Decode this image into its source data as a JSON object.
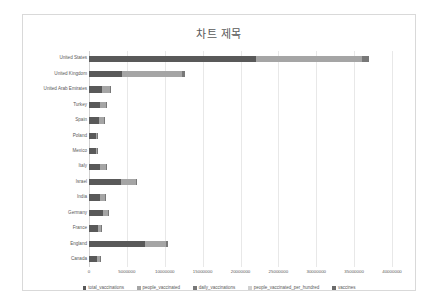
{
  "chart": {
    "title": "차트 제목"
  },
  "legend": {
    "position": "bottom",
    "items": [
      {
        "label": "total_vaccinations",
        "color": "#595959"
      },
      {
        "label": "people_vaccinated",
        "color": "#a5a5a5"
      },
      {
        "label": "daily_vaccinations",
        "color": "#787878"
      },
      {
        "label": "people_vaccinated_per_hundred",
        "color": "#d0d0d0"
      },
      {
        "label": "vaccines",
        "color": "#6b6b6b"
      }
    ]
  },
  "x_axis": {
    "ticks": [
      "0",
      "5000000",
      "10000000",
      "15000000",
      "20000000",
      "25000000",
      "30000000",
      "35000000",
      "40000000"
    ]
  },
  "chart_data": {
    "type": "bar",
    "orientation": "horizontal",
    "stacked": true,
    "title": "차트 제목",
    "xlabel": "",
    "ylabel": "",
    "xlim": [
      0,
      40000000
    ],
    "grid": true,
    "legend_position": "bottom",
    "categories": [
      "United States",
      "United Kingdom",
      "United Arab Emirates",
      "Turkey",
      "Spain",
      "Poland",
      "Mexico",
      "Italy",
      "Israel",
      "India",
      "Germany",
      "France",
      "England",
      "Canada"
    ],
    "series": [
      {
        "name": "total_vaccinations",
        "color": "#595959",
        "values": [
          22100000,
          4300000,
          1700000,
          1400000,
          1350000,
          900000,
          900000,
          1500000,
          4200000,
          1400000,
          1800000,
          1200000,
          7400000,
          1100000
        ]
      },
      {
        "name": "people_vaccinated",
        "color": "#a5a5a5",
        "values": [
          14000000,
          8000000,
          1100000,
          800000,
          600000,
          180000,
          150000,
          700000,
          2000000,
          700000,
          650000,
          450000,
          2800000,
          350000
        ]
      },
      {
        "name": "daily_vaccinations",
        "color": "#787878",
        "values": [
          900000,
          350000,
          70000,
          60000,
          50000,
          30000,
          30000,
          50000,
          120000,
          50000,
          60000,
          40000,
          280000,
          30000
        ]
      },
      {
        "name": "people_vaccinated_per_hundred",
        "color": "#d0d0d0",
        "values": [
          4.2,
          11.8,
          11.1,
          0.9,
          1.3,
          0.5,
          0.1,
          1.2,
          23.1,
          0.1,
          0.8,
          0.7,
          4.9,
          0.9
        ]
      },
      {
        "name": "vaccines",
        "color": "#6b6b6b",
        "values": [
          0,
          0,
          0,
          0,
          0,
          0,
          0,
          0,
          0,
          0,
          0,
          0,
          0,
          0
        ]
      }
    ]
  }
}
